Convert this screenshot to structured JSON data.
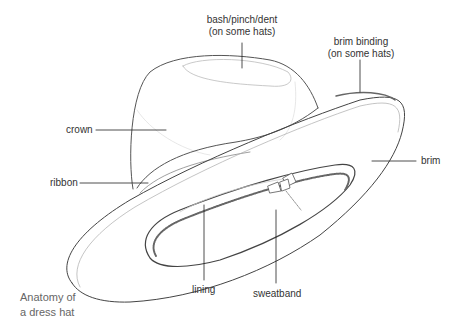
{
  "diagram": {
    "title": "Anatomy of a dress hat",
    "caption_lines": [
      "Anatomy of",
      "a dress hat"
    ],
    "labels": {
      "bash": {
        "line1": "bash/pinch/dent",
        "line2": "(on some hats)"
      },
      "brim_binding": {
        "line1": "brim binding",
        "line2": "(on some hats)"
      },
      "crown": "crown",
      "ribbon": "ribbon",
      "brim": "brim",
      "lining": "lining",
      "sweatband": "sweatband"
    },
    "colors": {
      "outline": "#555555",
      "light_outline": "#bbbbbb",
      "leader_line": "#222222",
      "label_text": "#333333",
      "caption_text": "#666666"
    }
  }
}
